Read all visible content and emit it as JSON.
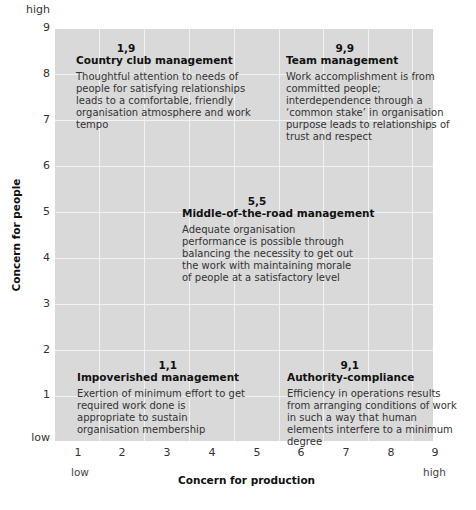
{
  "diagram": {
    "type": "managerial-grid",
    "y_axis": {
      "title": "Concern for people",
      "ticks": [
        "1",
        "2",
        "3",
        "4",
        "5",
        "6",
        "7",
        "8",
        "9"
      ],
      "low_label": "low",
      "high_label": "high"
    },
    "x_axis": {
      "title": "Concern for production",
      "ticks": [
        "1",
        "2",
        "3",
        "4",
        "5",
        "6",
        "7",
        "8",
        "9"
      ],
      "low_label": "low",
      "high_label": "high"
    },
    "styles": [
      {
        "coord": "1,9",
        "title": "Country club management",
        "description": "Thoughtful attention to needs of people for satisfying relationships leads to a comfortable, friendly organisation atmosphere and work tempo"
      },
      {
        "coord": "9,9",
        "title": "Team management",
        "description": "Work accomplishment is from committed people; interdependence through a ‘common stake’ in organisation purpose leads to relationships of trust and respect"
      },
      {
        "coord": "5,5",
        "title": "Middle-of-the-road management",
        "description": "Adequate organisation performance is possible through balancing the necessity to get out the work with maintaining morale of people at a satisfactory level"
      },
      {
        "coord": "1,1",
        "title": "Impoverished management",
        "description": "Exertion of minimum effort to get required work done is appropriate to sustain organisation membership"
      },
      {
        "coord": "9,1",
        "title": "Authority-compliance",
        "description": "Efficiency in operations results from arranging conditions of work in such a way that human elements interfere to a minimum degree"
      }
    ],
    "colors": {
      "grid_fill": "#d9d9d9",
      "grid_lines": "#f2f2f2"
    }
  }
}
